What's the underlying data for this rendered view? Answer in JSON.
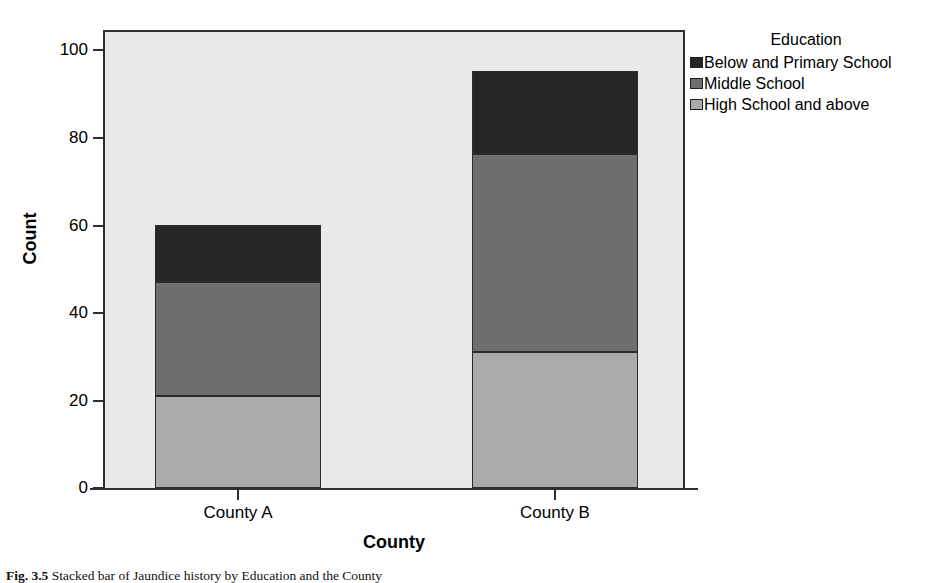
{
  "figure": {
    "caption_label": "Fig. 3.5",
    "caption_text": "Stacked bar of Jaundice history by Education and the County"
  },
  "chart_data": {
    "type": "bar",
    "title": "",
    "subtitle": "",
    "xlabel": "County",
    "ylabel": "Count",
    "categories": [
      "County A",
      "County B"
    ],
    "ylim": [
      0,
      100
    ],
    "yticks": [
      0,
      20,
      40,
      60,
      80,
      100
    ],
    "ytick_labels": [
      "0",
      "20",
      "40",
      "60",
      "80",
      "100"
    ],
    "grid": false,
    "stacked": true,
    "legend_title": "Education",
    "legend_position": "right",
    "series": [
      {
        "name": "High School and above",
        "color": "#ababab",
        "values": [
          21,
          31
        ]
      },
      {
        "name": "Middle School",
        "color": "#6e6e6e",
        "values": [
          26,
          45
        ]
      },
      {
        "name": "Below and Primary School",
        "color": "#262626",
        "values": [
          13,
          19
        ]
      }
    ],
    "totals": [
      60,
      95
    ],
    "cumulative_tops": {
      "County A": [
        21,
        47,
        60
      ],
      "County B": [
        31,
        76,
        95
      ]
    },
    "panel_background": "#e9e9e9",
    "frame_color": "#2e2e2e"
  }
}
